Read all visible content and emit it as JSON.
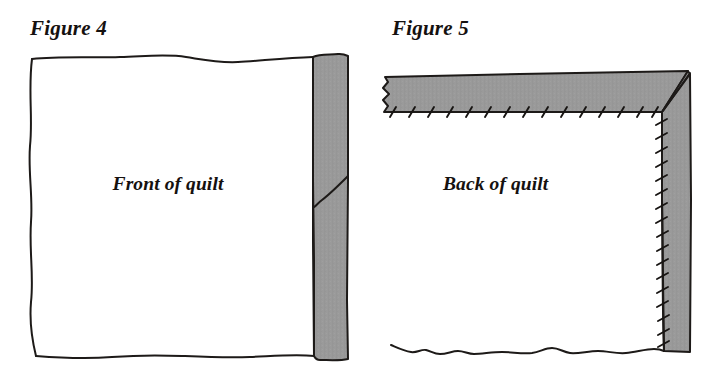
{
  "page": {
    "background_color": "#ffffff",
    "width": 715,
    "height": 391,
    "ink_color": "#1d1a18",
    "binding_fill_color": "#9a9a9a",
    "quilt_fill_color": "#ffffff"
  },
  "figures": [
    {
      "id": "figure-4",
      "caption": "Figure 4",
      "label": "Front of quilt",
      "description": "Quilt front with a gray binding strip applied along the right raw edge, showing a diagonal seam joining two binding pieces.",
      "binding": {
        "position": "right-edge",
        "fill": "#9a9a9a",
        "has_diagonal_seam": true,
        "stitch_marks": 0
      }
    },
    {
      "id": "figure-5",
      "caption": "Figure 5",
      "label": "Back of quilt",
      "description": "Quilt back with the gray binding folded over the top and right edges, hand-stitched down with slanted whipstitches and a mitered corner.",
      "binding": {
        "position": "top-and-right-edges",
        "fill": "#9a9a9a",
        "has_mitered_corner": true,
        "stitch_marks_top": 15,
        "stitch_marks_right": 17
      }
    }
  ],
  "geometry": {
    "figure4": {
      "caption_x": 30,
      "caption_y": 35,
      "label_x": 168,
      "label_y": 190,
      "quilt_left": 31,
      "quilt_right": 313,
      "quilt_top": 58,
      "quilt_bottom": 356,
      "binding_left": 313,
      "binding_right": 348,
      "binding_top": 54,
      "binding_bottom": 360,
      "seam_y_right": 176,
      "seam_y_left": 207
    },
    "figure5": {
      "caption_x": 392,
      "caption_y": 35,
      "label_x": 443,
      "label_y": 190,
      "quilt_left": 383,
      "quilt_right": 662,
      "quilt_bottom": 350,
      "band_top": 75,
      "band_bottom": 112,
      "right_band_left": 662,
      "right_band_right": 690,
      "corner_apex_x": 690,
      "corner_apex_y": 72
    }
  }
}
